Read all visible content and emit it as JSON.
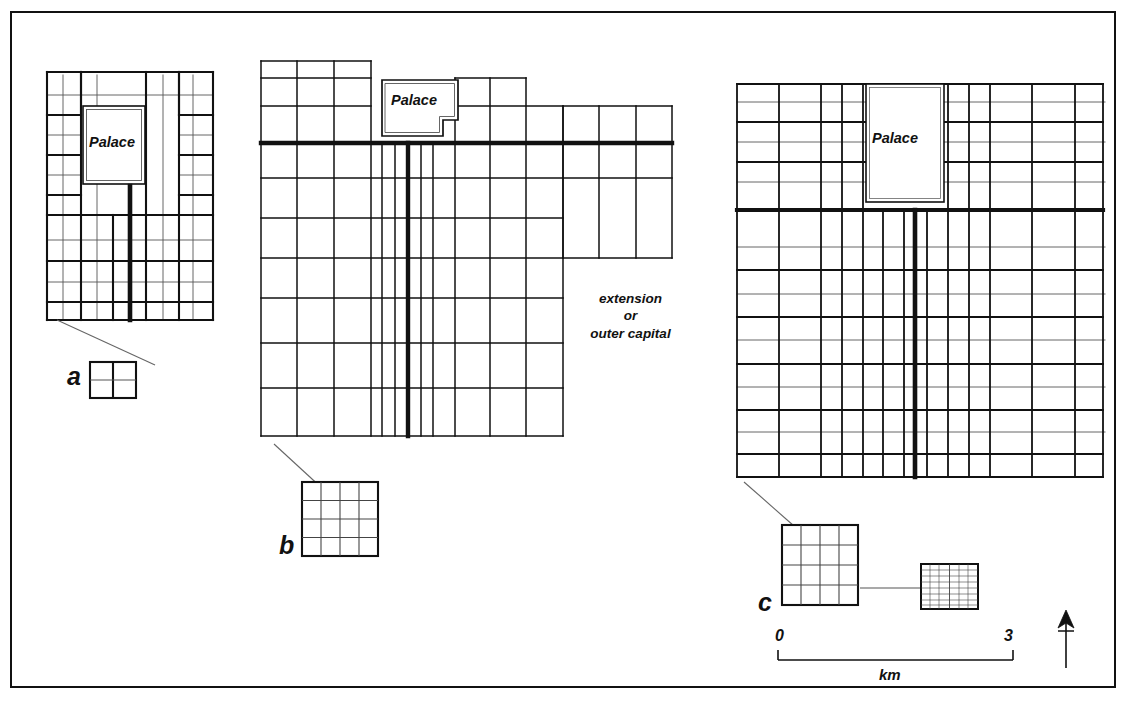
{
  "figure": {
    "type": "schematic-city-plans",
    "frame": {
      "stroke": "#111111",
      "width": 2.5
    },
    "background": "#ffffff",
    "ink": "#111111"
  },
  "plans": [
    {
      "id": "a",
      "letter": "a",
      "palace_label": "Palace",
      "description": "Small rectangular grid capital with central palace enclosure at north and a thick central avenue running south",
      "grid": {
        "ward_cols": 5,
        "ward_rows": 6,
        "blocks_per_ward": 2
      },
      "has_inset": true,
      "inset": {
        "rows": 2,
        "cols": 2,
        "label": "a"
      },
      "has_extension": false
    },
    {
      "id": "b",
      "letter": "b",
      "palace_label": "Palace",
      "description": "Large grid capital with irregular notched palace enclosure and an eastern extension block",
      "grid": {
        "ward_cols": 9,
        "ward_rows": 8,
        "blocks_per_ward": 1
      },
      "has_inset": true,
      "inset": {
        "rows": 4,
        "cols": 4,
        "label": "b"
      },
      "has_extension": true,
      "extension_label_lines": [
        "extension",
        "or",
        "outer capital"
      ]
    },
    {
      "id": "c",
      "letter": "c",
      "palace_label": "Palace",
      "description": "Dense grid capital with rectangular palace at north centre and thick central avenue",
      "grid": {
        "ward_cols": 9,
        "ward_rows": 12,
        "blocks_per_ward": 2
      },
      "has_inset": true,
      "inset": {
        "rows": 4,
        "cols": 4,
        "label": "c"
      },
      "has_subinset": true,
      "subinset": {
        "cols": 2,
        "rows": 8,
        "description": "very fine subdivided block detail"
      },
      "has_extension": false
    }
  ],
  "scale_bar": {
    "start_label": "0",
    "end_label": "3",
    "unit_label": "km",
    "length_px": 235
  },
  "north_arrow": {
    "name": "north-arrow",
    "direction": "up",
    "has_crossbar": true
  }
}
